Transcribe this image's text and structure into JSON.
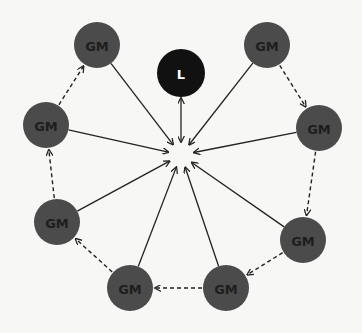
{
  "diagram": {
    "title": "",
    "colors": {
      "background": "#f7f7f6",
      "gm_fill": "#4b4b4b",
      "gm_text": "#1e1e1e",
      "leader_fill": "#111111",
      "leader_text": "#ffffff",
      "edge": "#222222"
    },
    "hub": {
      "x": 181,
      "y": 155,
      "radius": 13
    },
    "leader": {
      "id": "L",
      "label": "L",
      "x": 181,
      "y": 73,
      "r": 24
    },
    "nodes": [
      {
        "id": "gm1",
        "label": "GM",
        "x": 97,
        "y": 45,
        "r": 23
      },
      {
        "id": "gm2",
        "label": "GM",
        "x": 46,
        "y": 125,
        "r": 23
      },
      {
        "id": "gm3",
        "label": "GM",
        "x": 57,
        "y": 222,
        "r": 23
      },
      {
        "id": "gm4",
        "label": "GM",
        "x": 130,
        "y": 288,
        "r": 23
      },
      {
        "id": "gm5",
        "label": "GM",
        "x": 226,
        "y": 288,
        "r": 23
      },
      {
        "id": "gm6",
        "label": "GM",
        "x": 303,
        "y": 240,
        "r": 23
      },
      {
        "id": "gm7",
        "label": "GM",
        "x": 319,
        "y": 128,
        "r": 23
      },
      {
        "id": "gm8",
        "label": "GM",
        "x": 267,
        "y": 45,
        "r": 23
      }
    ],
    "solid_edges_to_hub": [
      "gm1",
      "gm2",
      "gm3",
      "gm4",
      "gm5",
      "gm6",
      "gm7",
      "gm8"
    ],
    "leader_edge": {
      "from": "L",
      "to": "hub",
      "bidirectional": true
    },
    "dashed_edges": [
      {
        "from": "gm2",
        "to": "gm1"
      },
      {
        "from": "gm3",
        "to": "gm2"
      },
      {
        "from": "gm4",
        "to": "gm3"
      },
      {
        "from": "gm5",
        "to": "gm4"
      },
      {
        "from": "gm6",
        "to": "gm5"
      },
      {
        "from": "gm7",
        "to": "gm6"
      },
      {
        "from": "gm8",
        "to": "gm7"
      }
    ]
  }
}
